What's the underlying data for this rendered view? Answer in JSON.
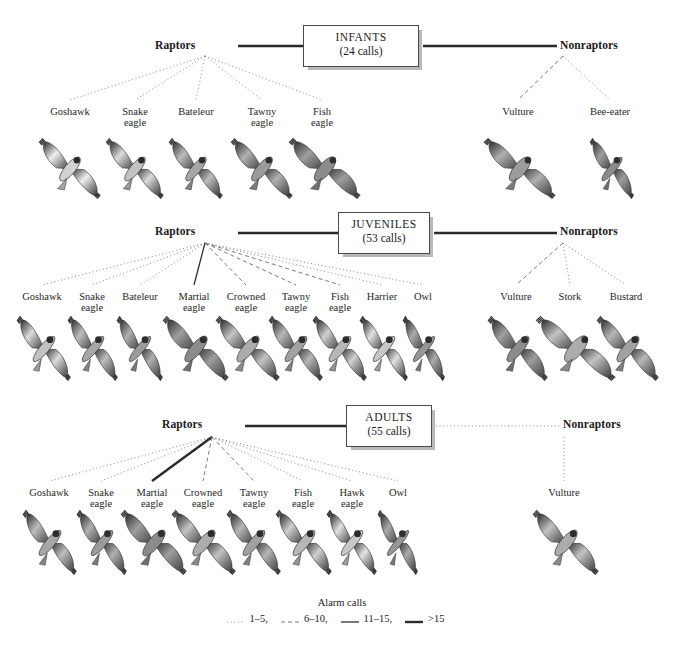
{
  "figure": {
    "background": "#ffffff",
    "line_color": "#555555",
    "text_color": "#1a1a1a"
  },
  "legend": {
    "title": "Alarm calls",
    "items": [
      {
        "label": "1–5",
        "style": "dotted",
        "suffix": ","
      },
      {
        "label": "6–10",
        "style": "dashed",
        "suffix": ","
      },
      {
        "label": "11–15",
        "style": "solid-thin",
        "suffix": ","
      },
      {
        "label": ">15",
        "style": "solid-thick",
        "suffix": ""
      }
    ]
  },
  "sections": [
    {
      "id": "infants",
      "box": {
        "title": "INFANTS",
        "subtitle": "(24 calls)"
      },
      "left_node": "Raptors",
      "right_node": "Nonraptors",
      "left_connector": "solid-thick",
      "right_connector": "solid-thick",
      "left_leaves": [
        {
          "name": "Goshawk",
          "lines": [
            "Goshawk"
          ],
          "style": "dotted"
        },
        {
          "name": "Snake eagle",
          "lines": [
            "Snake",
            "eagle"
          ],
          "style": "dotted"
        },
        {
          "name": "Bateleur",
          "lines": [
            "Bateleur"
          ],
          "style": "dotted"
        },
        {
          "name": "Tawny eagle",
          "lines": [
            "Tawny",
            "eagle"
          ],
          "style": "dotted"
        },
        {
          "name": "Fish eagle",
          "lines": [
            "Fish",
            "eagle"
          ],
          "style": "dotted"
        }
      ],
      "right_leaves": [
        {
          "name": "Vulture",
          "lines": [
            "Vulture"
          ],
          "style": "dashed"
        },
        {
          "name": "Bee-eater",
          "lines": [
            "Bee-eater"
          ],
          "style": "dotted"
        }
      ]
    },
    {
      "id": "juveniles",
      "box": {
        "title": "JUVENILES",
        "subtitle": "(53 calls)"
      },
      "left_node": "Raptors",
      "right_node": "Nonraptors",
      "left_connector": "solid-thick",
      "right_connector": "solid-thick",
      "left_leaves": [
        {
          "name": "Goshawk",
          "lines": [
            "Goshawk"
          ],
          "style": "dotted"
        },
        {
          "name": "Snake eagle",
          "lines": [
            "Snake",
            "eagle"
          ],
          "style": "dotted"
        },
        {
          "name": "Bateleur",
          "lines": [
            "Bateleur"
          ],
          "style": "dotted"
        },
        {
          "name": "Martial eagle",
          "lines": [
            "Martial",
            "eagle"
          ],
          "style": "solid-thin"
        },
        {
          "name": "Crowned eagle",
          "lines": [
            "Crowned",
            "eagle"
          ],
          "style": "dashed"
        },
        {
          "name": "Tawny eagle",
          "lines": [
            "Tawny",
            "eagle"
          ],
          "style": "dashed"
        },
        {
          "name": "Fish eagle",
          "lines": [
            "Fish",
            "eagle"
          ],
          "style": "dashed"
        },
        {
          "name": "Harrier",
          "lines": [
            "Harrier"
          ],
          "style": "dotted"
        },
        {
          "name": "Owl",
          "lines": [
            "Owl"
          ],
          "style": "dotted"
        }
      ],
      "right_leaves": [
        {
          "name": "Vulture",
          "lines": [
            "Vulture"
          ],
          "style": "dashed"
        },
        {
          "name": "Stork",
          "lines": [
            "Stork"
          ],
          "style": "dotted"
        },
        {
          "name": "Bustard",
          "lines": [
            "Bustard"
          ],
          "style": "dotted"
        }
      ]
    },
    {
      "id": "adults",
      "box": {
        "title": "ADULTS",
        "subtitle": "(55 calls)"
      },
      "left_node": "Raptors",
      "right_node": "Nonraptors",
      "left_connector": "solid-thick",
      "right_connector": "dotted",
      "left_leaves": [
        {
          "name": "Goshawk",
          "lines": [
            "Goshawk"
          ],
          "style": "dotted"
        },
        {
          "name": "Snake eagle",
          "lines": [
            "Snake",
            "eagle"
          ],
          "style": "dotted"
        },
        {
          "name": "Martial eagle",
          "lines": [
            "Martial",
            "eagle"
          ],
          "style": "solid-thick"
        },
        {
          "name": "Crowned eagle",
          "lines": [
            "Crowned",
            "eagle"
          ],
          "style": "dashed"
        },
        {
          "name": "Tawny eagle",
          "lines": [
            "Tawny",
            "eagle"
          ],
          "style": "dashed"
        },
        {
          "name": "Fish eagle",
          "lines": [
            "Fish",
            "eagle"
          ],
          "style": "dotted"
        },
        {
          "name": "Hawk eagle",
          "lines": [
            "Hawk",
            "eagle"
          ],
          "style": "dotted"
        },
        {
          "name": "Owl",
          "lines": [
            "Owl"
          ],
          "style": "dotted"
        }
      ],
      "right_leaves": [
        {
          "name": "Vulture",
          "lines": [
            "Vulture"
          ],
          "style": "dotted"
        }
      ]
    }
  ],
  "layout": {
    "sections": [
      {
        "id": "infants",
        "node_y": 46,
        "leaf_label_y": 106,
        "bird_y": 140,
        "bird_h": 58,
        "left_node_x": 196,
        "right_node_x": 560,
        "box": {
          "x": 303,
          "y": 25,
          "w": 116,
          "h": 42
        },
        "left_hub": {
          "x": 205,
          "y": 56
        },
        "right_hub": {
          "x": 563,
          "y": 56
        },
        "left_leaf_x": [
          70,
          135,
          196,
          262,
          322
        ],
        "left_bird_x": [
          70,
          135,
          196,
          262,
          325
        ],
        "left_bird_w": [
          62,
          58,
          54,
          62,
          72
        ],
        "right_leaf_x": [
          518,
          610
        ],
        "right_bird_x": [
          520,
          612
        ],
        "right_bird_w": [
          72,
          44
        ]
      },
      {
        "id": "juveniles",
        "node_y": 232,
        "leaf_label_y": 291,
        "bird_y": 318,
        "bird_h": 62,
        "left_node_x": 196,
        "right_node_x": 560,
        "box": {
          "x": 338,
          "y": 212,
          "w": 92,
          "h": 42
        },
        "left_hub": {
          "x": 205,
          "y": 243
        },
        "right_hub": {
          "x": 563,
          "y": 243
        },
        "left_leaf_x": [
          42,
          92,
          140,
          194,
          246,
          296,
          340,
          382,
          423
        ],
        "left_bird_x": [
          44,
          93,
          140,
          196,
          248,
          296,
          340,
          384,
          424
        ],
        "left_bird_w": [
          54,
          50,
          46,
          66,
          64,
          54,
          54,
          48,
          42
        ],
        "right_leaf_x": [
          516,
          570,
          626
        ],
        "right_bird_x": [
          518,
          576,
          628
        ],
        "right_bird_w": [
          60,
          80,
          62
        ],
        "box_note": "juvenile box"
      },
      {
        "id": "adults",
        "node_y": 425,
        "leaf_label_y": 487,
        "bird_y": 512,
        "bird_h": 62,
        "left_node_x": 203,
        "right_node_x": 563,
        "box": {
          "x": 346,
          "y": 405,
          "w": 86,
          "h": 42
        },
        "left_hub": {
          "x": 212,
          "y": 437
        },
        "right_hub": {
          "x": 564,
          "y": 437
        },
        "left_leaf_x": [
          49,
          101,
          152,
          203,
          254,
          303,
          352,
          398
        ],
        "left_bird_x": [
          50,
          102,
          154,
          204,
          254,
          304,
          352,
          398
        ],
        "left_bird_w": [
          54,
          50,
          66,
          64,
          54,
          56,
          50,
          40
        ],
        "right_leaf_x": [
          564
        ],
        "right_bird_x": [
          566
        ],
        "right_bird_w": [
          66
        ]
      }
    ]
  }
}
